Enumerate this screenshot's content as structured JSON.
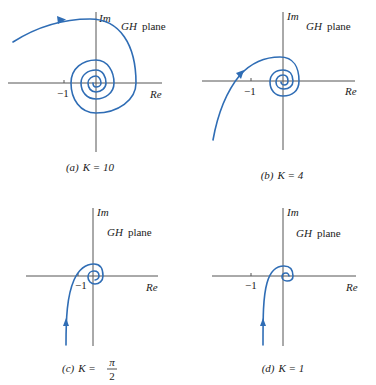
{
  "figure": {
    "plot_color": "#2f6db5",
    "axis_color": "#555555",
    "panels": [
      {
        "id": "a",
        "axis_labels": {
          "imag": "Im",
          "real": "Re"
        },
        "plane_label": {
          "gh": "GH",
          "word": "plane"
        },
        "tick_label": "−1",
        "caption": {
          "letter": "(a)",
          "text": "K = 10"
        }
      },
      {
        "id": "b",
        "axis_labels": {
          "imag": "Im",
          "real": "Re"
        },
        "plane_label": {
          "gh": "GH",
          "word": "plane"
        },
        "tick_label": "−1",
        "caption": {
          "letter": "(b)",
          "text": "K = 4"
        }
      },
      {
        "id": "c",
        "axis_labels": {
          "imag": "Im",
          "real": "Re"
        },
        "plane_label": {
          "gh": "GH",
          "word": "plane"
        },
        "tick_label": "−1",
        "caption": {
          "letter": "(c)",
          "prefix": "K =",
          "frac_num": "π",
          "frac_den": "2"
        }
      },
      {
        "id": "d",
        "axis_labels": {
          "imag": "Im",
          "real": "Re"
        },
        "plane_label": {
          "gh": "GH",
          "word": "plane"
        },
        "tick_label": "−1",
        "caption": {
          "letter": "(d)",
          "text": "K = 1"
        }
      }
    ]
  }
}
